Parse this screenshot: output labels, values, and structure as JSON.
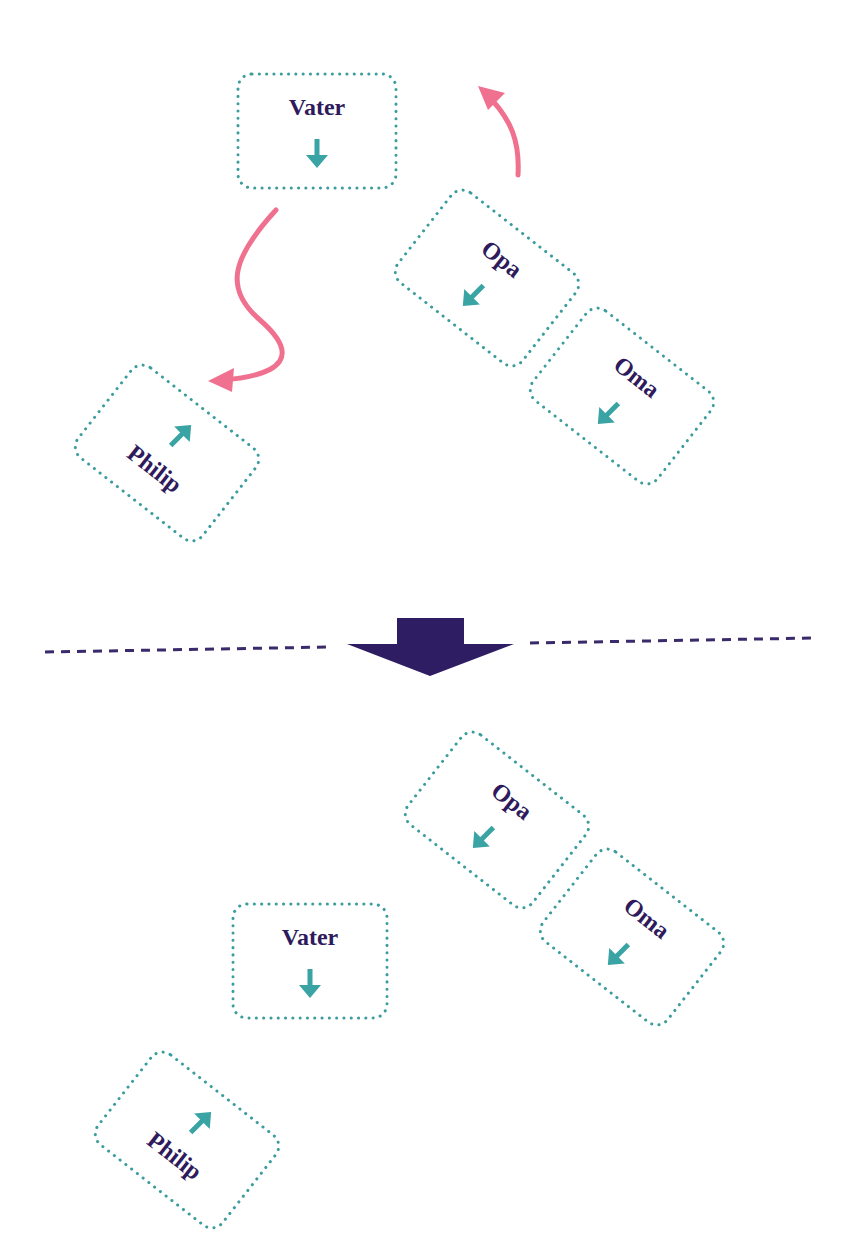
{
  "colors": {
    "box_border": "#3a9c9c",
    "label_text": "#2e1a5c",
    "direction_arrow": "#3aa3a3",
    "move_arrow": "#f0718f",
    "divider": "#3b2a6b",
    "transition_arrow": "#2f1d63"
  },
  "before": {
    "boxes": [
      {
        "id": "vater",
        "label": "Vater",
        "cx": 317,
        "cy": 131,
        "w": 158,
        "h": 114,
        "rotate": 0,
        "arrow": "down",
        "label_dx": 0,
        "label_dy": -24,
        "arrow_dx": 0,
        "arrow_dy": 22
      },
      {
        "id": "opa",
        "label": "Opa",
        "cx": 487,
        "cy": 278,
        "w": 158,
        "h": 114,
        "rotate": 38,
        "arrow": "down-left",
        "label_dx": 0,
        "label_dy": -24,
        "arrow_dx": 0,
        "arrow_dy": 22
      },
      {
        "id": "oma",
        "label": "Oma",
        "cx": 622,
        "cy": 396,
        "w": 158,
        "h": 114,
        "rotate": 38,
        "arrow": "down-left",
        "label_dx": 0,
        "label_dy": -24,
        "arrow_dx": 0,
        "arrow_dy": 22
      },
      {
        "id": "philip",
        "label": "Philip",
        "cx": 167,
        "cy": 453,
        "w": 158,
        "h": 114,
        "rotate": 38,
        "arrow": "up-right",
        "label_dx": 0,
        "label_dy": 20,
        "arrow_dx": 0,
        "arrow_dy": -22
      }
    ],
    "move_arrows": [
      {
        "id": "vater-to-philip",
        "path": "M 276 210 C 230 260, 225 290, 260 320 C 300 355, 285 375, 222 380",
        "head": "down-left"
      },
      {
        "id": "opa-up",
        "path": "M 518 175 C 520 140, 510 120, 492 100",
        "head": "up-left"
      }
    ]
  },
  "transition": {
    "divider_y_left": 652,
    "divider_y_right": 640,
    "arrow_label": "transition-arrow"
  },
  "after": {
    "boxes": [
      {
        "id": "opa",
        "label": "Opa",
        "cx": 497,
        "cy": 820,
        "w": 158,
        "h": 114,
        "rotate": 38,
        "arrow": "down-left",
        "label_dx": 0,
        "label_dy": -24,
        "arrow_dx": 0,
        "arrow_dy": 22
      },
      {
        "id": "oma",
        "label": "Oma",
        "cx": 632,
        "cy": 937,
        "w": 158,
        "h": 114,
        "rotate": 38,
        "arrow": "down-left",
        "label_dx": 0,
        "label_dy": -24,
        "arrow_dx": 0,
        "arrow_dy": 22
      },
      {
        "id": "vater",
        "label": "Vater",
        "cx": 310,
        "cy": 961,
        "w": 154,
        "h": 114,
        "rotate": 0,
        "arrow": "down",
        "label_dx": 0,
        "label_dy": -24,
        "arrow_dx": 0,
        "arrow_dy": 22
      },
      {
        "id": "philip",
        "label": "Philip",
        "cx": 187,
        "cy": 1140,
        "w": 158,
        "h": 114,
        "rotate": 38,
        "arrow": "up-right",
        "label_dx": 0,
        "label_dy": 20,
        "arrow_dx": 0,
        "arrow_dy": -22
      }
    ]
  }
}
